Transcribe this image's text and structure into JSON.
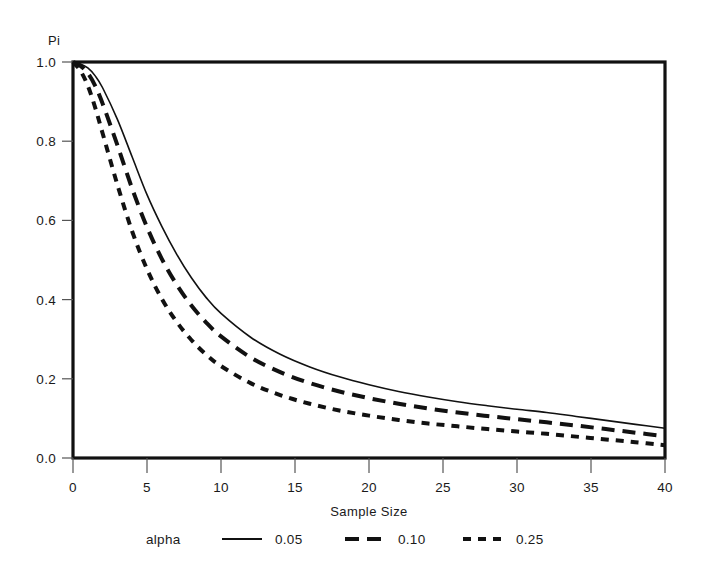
{
  "chart_data": {
    "type": "line",
    "title": "",
    "xlabel": "Sample Size",
    "ylabel": "Pi",
    "xlim": [
      0,
      40
    ],
    "ylim": [
      0.0,
      1.0
    ],
    "grid": false,
    "legend_position": "bottom",
    "legend_title": "alpha",
    "xticks": [
      "0",
      "5",
      "10",
      "15",
      "20",
      "25",
      "30",
      "35",
      "40"
    ],
    "xtick_values": [
      0,
      5,
      10,
      15,
      20,
      25,
      30,
      35,
      40
    ],
    "yticks": [
      "0.0",
      "0.2",
      "0.4",
      "0.6",
      "0.8",
      "1.0"
    ],
    "ytick_values": [
      0.0,
      0.2,
      0.4,
      0.6,
      0.8,
      1.0
    ],
    "x": [
      0,
      0.5,
      1,
      1.5,
      2,
      3,
      4,
      5,
      6,
      7,
      8,
      9,
      10,
      12,
      14,
      16,
      18,
      20,
      22,
      24,
      26,
      28,
      30,
      32,
      34,
      36,
      38,
      40
    ],
    "series": [
      {
        "name": "0.05",
        "label": "0.05",
        "linestyle": "solid",
        "dasharray": "",
        "width": 1.6,
        "color": "#111111",
        "values": [
          1.0,
          0.995,
          0.985,
          0.965,
          0.935,
          0.855,
          0.76,
          0.665,
          0.585,
          0.515,
          0.455,
          0.405,
          0.365,
          0.305,
          0.262,
          0.23,
          0.205,
          0.185,
          0.168,
          0.154,
          0.142,
          0.132,
          0.123,
          0.115,
          0.105,
          0.095,
          0.085,
          0.075
        ]
      },
      {
        "name": "0.10",
        "label": "0.10",
        "linestyle": "dashed",
        "dasharray": "13,8",
        "width": 4.0,
        "color": "#111111",
        "values": [
          1.0,
          0.99,
          0.972,
          0.94,
          0.895,
          0.79,
          0.68,
          0.583,
          0.503,
          0.438,
          0.385,
          0.342,
          0.307,
          0.254,
          0.217,
          0.189,
          0.168,
          0.151,
          0.137,
          0.125,
          0.115,
          0.106,
          0.098,
          0.09,
          0.082,
          0.073,
          0.064,
          0.055
        ]
      },
      {
        "name": "0.25",
        "label": "0.25",
        "linestyle": "short-dashed",
        "dasharray": "8,7",
        "width": 4.0,
        "color": "#111111",
        "values": [
          1.0,
          0.978,
          0.94,
          0.885,
          0.82,
          0.69,
          0.572,
          0.477,
          0.402,
          0.344,
          0.298,
          0.261,
          0.232,
          0.189,
          0.159,
          0.137,
          0.12,
          0.107,
          0.096,
          0.087,
          0.08,
          0.073,
          0.067,
          0.061,
          0.054,
          0.047,
          0.04,
          0.032
        ]
      }
    ]
  },
  "legend": {
    "title": "alpha",
    "entries": [
      {
        "label": "0.05",
        "style": "solid"
      },
      {
        "label": "0.10",
        "style": "dashed"
      },
      {
        "label": "0.25",
        "style": "short-dashed"
      }
    ]
  }
}
